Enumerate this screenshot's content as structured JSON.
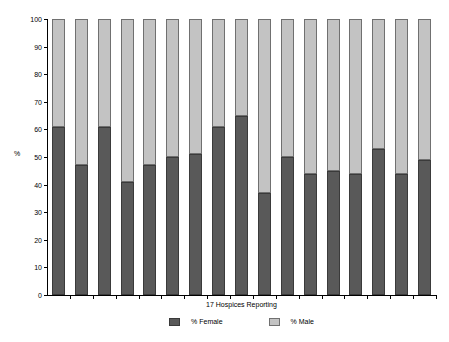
{
  "chart_data": {
    "type": "bar",
    "subtype": "stacked-100-percent",
    "title": "",
    "xlabel": "17 Hospices Reporting",
    "ylabel": "%",
    "ylim": [
      0,
      100
    ],
    "ytick_step": 10,
    "ytick_labels": [
      "0",
      "10",
      "20",
      "30",
      "40",
      "50",
      "60",
      "70",
      "80",
      "90",
      "100"
    ],
    "grid": false,
    "legend_position": "bottom-center",
    "categories": [
      "1",
      "2",
      "3",
      "4",
      "5",
      "6",
      "7",
      "8",
      "9",
      "10",
      "11",
      "12",
      "13",
      "14",
      "15",
      "16",
      "17"
    ],
    "series": [
      {
        "name": "% Female",
        "color": "#595959",
        "values": [
          61,
          47,
          61,
          41,
          47,
          50,
          51,
          61,
          65,
          37,
          50,
          44,
          45,
          44,
          53,
          44,
          49
        ]
      },
      {
        "name": "% Male",
        "color": "#c3c3c3",
        "values": [
          39,
          53,
          39,
          59,
          53,
          50,
          49,
          39,
          35,
          63,
          50,
          56,
          55,
          56,
          47,
          56,
          51
        ]
      }
    ]
  },
  "legend": {
    "items": [
      {
        "label": "% Female",
        "swatch": "female"
      },
      {
        "label": "% Male",
        "swatch": "male"
      }
    ]
  }
}
